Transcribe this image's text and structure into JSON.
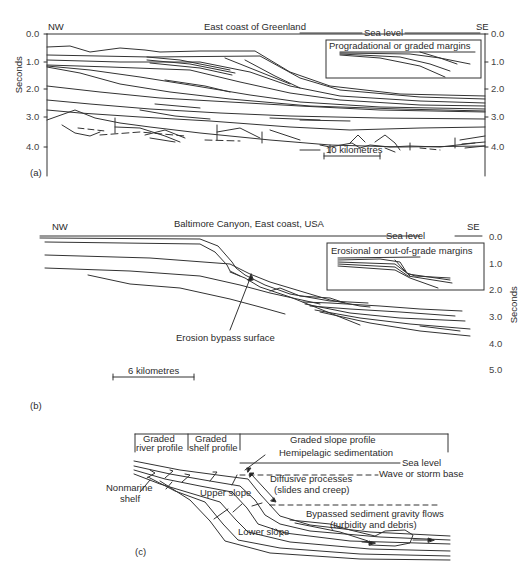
{
  "panel_a": {
    "label": "(a)",
    "title": "East coast of Greenland",
    "left_dir": "NW",
    "right_dir": "SE",
    "sea_level": "Sea level",
    "inset_title": "Progradational or graded margins",
    "y_axis_label": "Seconds",
    "y_ticks": [
      "0.0",
      "1.0",
      "2.0",
      "3.0",
      "4.0"
    ],
    "scale_bar": "10 kilometres"
  },
  "panel_b": {
    "label": "(b)",
    "title": "Baltimore Canyon, East coast, USA",
    "left_dir": "NW",
    "right_dir": "SE",
    "sea_level": "Sea level",
    "inset_title": "Erosional or out-of-grade margins",
    "annotation": "Erosion bypass surface",
    "y_axis_label": "Seconds",
    "y_ticks": [
      "0.0",
      "1.0",
      "2.0",
      "3.0",
      "4.0",
      "5.0"
    ],
    "scale_bar": "6 kilometres"
  },
  "panel_c": {
    "label": "(c)",
    "header_boxes": [
      "Graded river profile",
      "Graded shelf profile",
      "Graded slope profile"
    ],
    "header_box_lines": [
      [
        "Graded",
        "river profile"
      ],
      [
        "Graded",
        "shelf profile"
      ]
    ],
    "sea_level": "Sea level",
    "wave_base": "Wave or storm base",
    "hemipelagic": "Hemipelagic sedimentation",
    "diffusive_1": "Diffusive processes",
    "diffusive_2": "(slides and creep)",
    "bypassed_1": "Bypassed sediment gravity flows",
    "bypassed_2": "(turbidity and debris)",
    "nonmarine": "Nonmarine",
    "shelf": "shelf",
    "upper_slope": "Upper slope",
    "lower_slope": "Lower slope"
  }
}
